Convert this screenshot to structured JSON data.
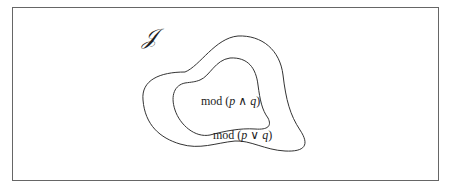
{
  "figure": {
    "universe_symbol": "𝒥",
    "regions": [
      {
        "name": "outer",
        "label_prefix": "mod (",
        "label_p": "p",
        "label_op": " ∨ ",
        "label_q": "q",
        "label_suffix": ")"
      },
      {
        "name": "inner",
        "label_prefix": "mod (",
        "label_p": "p",
        "label_op": " ∧ ",
        "label_q": "q",
        "label_suffix": ")"
      }
    ],
    "colors": {
      "stroke": "#333333",
      "frame": "#666666",
      "background": "#ffffff"
    }
  }
}
